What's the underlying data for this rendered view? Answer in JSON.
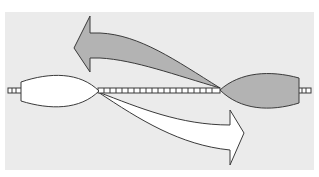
{
  "diagram": {
    "colors": {
      "background": "#ffffff",
      "panel": "#ebebeb",
      "outline": "#3a3a3a",
      "left_element_fill": "#ffffff",
      "right_element_fill": "#b3b3b3",
      "left_arrow_fill": "#b3b3b3",
      "right_arrow_fill": "#ffffff",
      "dna_fill": "#ffffff"
    },
    "elements": [
      {
        "id": "left-lens",
        "shape": "lens",
        "fill": "white"
      },
      {
        "id": "right-lens",
        "shape": "lens",
        "fill": "gray"
      },
      {
        "id": "dna-ladder",
        "shape": "ladder"
      },
      {
        "id": "gray-arrow",
        "direction": "left",
        "origin": "right-lens"
      },
      {
        "id": "white-arrow",
        "direction": "right",
        "origin": "left-lens"
      }
    ]
  }
}
